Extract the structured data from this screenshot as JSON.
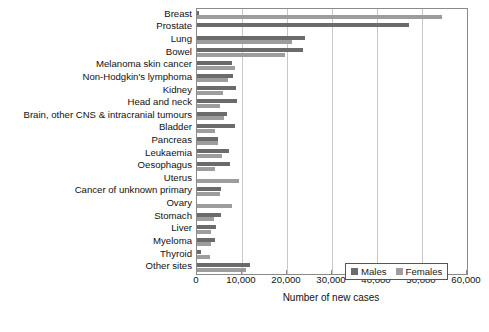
{
  "chart_data": {
    "type": "bar",
    "orientation": "horizontal",
    "title": "",
    "xlabel": "Number of new cases",
    "ylabel": "",
    "xlim": [
      0,
      60000
    ],
    "xticks": [
      0,
      10000,
      20000,
      30000,
      40000,
      50000,
      60000
    ],
    "xtick_labels": [
      "0",
      "10,000",
      "20,000",
      "30,000",
      "40,000",
      "50,000",
      "60,000"
    ],
    "grid": true,
    "legend_position": "bottom-right",
    "categories": [
      "Breast",
      "Prostate",
      "Lung",
      "Bowel",
      "Melanoma skin cancer",
      "Non-Hodgkin's lymphoma",
      "Kidney",
      "Head and neck",
      "Brain, other CNS & intracranial tumours",
      "Bladder",
      "Pancreas",
      "Leukaemia",
      "Oesophagus",
      "Uterus",
      "Cancer of unknown primary",
      "Ovary",
      "Stomach",
      "Liver",
      "Myeloma",
      "Thyroid",
      "Other sites"
    ],
    "series": [
      {
        "name": "Males",
        "color": "#6b6b6b",
        "values": [
          350,
          47000,
          24000,
          23500,
          7800,
          8100,
          8700,
          8900,
          6600,
          8500,
          4600,
          7200,
          7400,
          0,
          5400,
          0,
          5400,
          4200,
          4000,
          900,
          11800
        ]
      },
      {
        "name": "Females",
        "color": "#9d9d9d",
        "values": [
          54500,
          0,
          21000,
          19500,
          8500,
          6900,
          5700,
          5100,
          5900,
          4000,
          4700,
          5600,
          4000,
          9300,
          5200,
          7700,
          3700,
          3100,
          3200,
          2900,
          10900
        ]
      }
    ]
  },
  "legend": {
    "entries": [
      {
        "label": "Males"
      },
      {
        "label": "Females"
      }
    ]
  }
}
